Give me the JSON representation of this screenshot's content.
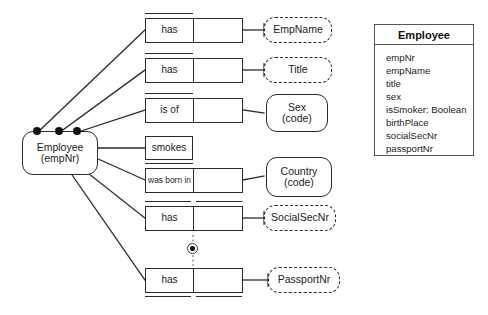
{
  "diagram": {
    "kind": "orm-diagram-with-uml-class",
    "background": "#ffffff",
    "stroke": "#2b2b2b"
  },
  "entity": {
    "name": "Employee",
    "reference": "(empNr)"
  },
  "fact_types": [
    {
      "id": "has-empname",
      "predicate": "has",
      "roles": 2
    },
    {
      "id": "has-title",
      "predicate": "has",
      "roles": 2
    },
    {
      "id": "is-of-sex",
      "predicate": "is of",
      "roles": 2
    },
    {
      "id": "smokes",
      "predicate": "smokes",
      "roles": 1
    },
    {
      "id": "was-born-in",
      "predicate": "was born in",
      "roles": 2
    },
    {
      "id": "has-ssn",
      "predicate": "has",
      "roles": 2
    },
    {
      "id": "has-passport",
      "predicate": "has",
      "roles": 2
    }
  ],
  "object_types": [
    {
      "id": "empname",
      "label": "EmpName",
      "sub": "",
      "style": "value"
    },
    {
      "id": "title",
      "label": "Title",
      "sub": "",
      "style": "value"
    },
    {
      "id": "sex",
      "label": "Sex",
      "sub": "(code)",
      "style": "entity"
    },
    {
      "id": "country",
      "label": "Country",
      "sub": "(code)",
      "style": "entity"
    },
    {
      "id": "socialsecnr",
      "label": "SocialSecNr",
      "sub": "",
      "style": "value"
    },
    {
      "id": "passportnr",
      "label": "PassportNr",
      "sub": "",
      "style": "value"
    }
  ],
  "constraints": {
    "mandatory_dots": 3,
    "exclusion_symbol": "circled-dot"
  },
  "uml_class": {
    "title": "Employee",
    "attributes": [
      "empNr",
      "empName",
      "title",
      "sex",
      "isSmoker: Boolean",
      "birthPlace",
      "socialSecNr",
      "passportNr"
    ]
  }
}
